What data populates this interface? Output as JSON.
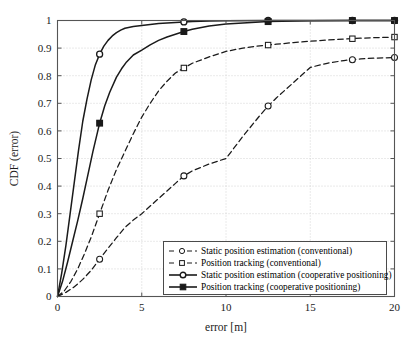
{
  "chart_data": {
    "type": "line",
    "title": "",
    "xlabel": "error [m]",
    "ylabel": "CDF (error)",
    "xlim": [
      0,
      20
    ],
    "ylim": [
      0,
      1
    ],
    "xticks": [
      "0",
      "5",
      "10",
      "15",
      "20"
    ],
    "xtick_values": [
      0,
      5,
      10,
      15,
      20
    ],
    "yticks": [
      "0",
      "0.1",
      "0.2",
      "0.3",
      "0.4",
      "0.5",
      "0.6",
      "0.7",
      "0.8",
      "0.9",
      "1"
    ],
    "ytick_values": [
      0,
      0.1,
      0.2,
      0.3,
      0.4,
      0.5,
      0.6,
      0.7,
      0.8,
      0.9,
      1
    ],
    "grid": true,
    "grid_style": "dotted",
    "legend_position": "lower right",
    "series": [
      {
        "name": "Static position estimation (conventional)",
        "style": "dashed",
        "marker": "circle",
        "marker_fill": "none",
        "color": "#1a1a1a",
        "x": [
          0,
          0.5,
          1,
          1.5,
          2,
          2.5,
          3,
          3.5,
          4,
          4.5,
          5,
          6,
          7,
          7.5,
          8,
          9,
          10,
          11,
          12,
          12.5,
          13,
          14,
          15,
          16,
          17,
          17.5,
          18,
          19,
          20
        ],
        "y": [
          0,
          0.015,
          0.035,
          0.062,
          0.095,
          0.135,
          0.175,
          0.213,
          0.25,
          0.277,
          0.3,
          0.355,
          0.41,
          0.437,
          0.455,
          0.48,
          0.5,
          0.58,
          0.655,
          0.69,
          0.72,
          0.775,
          0.83,
          0.845,
          0.855,
          0.858,
          0.861,
          0.864,
          0.866
        ],
        "markers_x": [
          2.5,
          7.5,
          12.5,
          17.5,
          20
        ],
        "markers_y": [
          0.135,
          0.437,
          0.69,
          0.858,
          0.866
        ]
      },
      {
        "name": "Position tracking (conventional)",
        "style": "dashed",
        "marker": "square",
        "marker_fill": "none",
        "color": "#1a1a1a",
        "x": [
          0,
          0.4,
          0.8,
          1.2,
          1.6,
          2,
          2.5,
          3,
          3.5,
          4,
          4.5,
          5,
          5.5,
          6,
          6.5,
          7,
          7.5,
          8,
          9,
          10,
          11,
          12,
          12.5,
          13,
          14,
          15,
          16,
          17,
          17.5,
          18,
          19,
          20
        ],
        "y": [
          0,
          0.02,
          0.055,
          0.1,
          0.155,
          0.215,
          0.3,
          0.385,
          0.46,
          0.525,
          0.59,
          0.65,
          0.7,
          0.745,
          0.78,
          0.81,
          0.828,
          0.845,
          0.868,
          0.888,
          0.9,
          0.908,
          0.911,
          0.914,
          0.92,
          0.925,
          0.929,
          0.933,
          0.934,
          0.936,
          0.938,
          0.94
        ],
        "markers_x": [
          2.5,
          7.5,
          12.5,
          17.5,
          20
        ],
        "markers_y": [
          0.3,
          0.828,
          0.911,
          0.934,
          0.94
        ]
      },
      {
        "name": "Static position estimation (cooperative positioning)",
        "style": "solid",
        "marker": "circle",
        "marker_fill": "none",
        "color": "#1a1a1a",
        "x": [
          0,
          0.25,
          0.5,
          0.75,
          1,
          1.25,
          1.5,
          1.75,
          2,
          2.25,
          2.5,
          2.75,
          3,
          3.25,
          3.5,
          3.75,
          4,
          4.5,
          5,
          6,
          7,
          7.5,
          8,
          9,
          10,
          12.5,
          15,
          17.5,
          20
        ],
        "y": [
          0,
          0.085,
          0.185,
          0.3,
          0.415,
          0.53,
          0.635,
          0.715,
          0.785,
          0.84,
          0.878,
          0.907,
          0.928,
          0.944,
          0.956,
          0.965,
          0.972,
          0.978,
          0.982,
          0.989,
          0.993,
          0.995,
          0.996,
          0.998,
          0.999,
          1.0,
          1.0,
          1.0,
          1.0
        ],
        "markers_x": [
          2.5,
          7.5,
          12.5,
          17.5,
          20
        ],
        "markers_y": [
          0.878,
          0.995,
          1.0,
          1.0,
          1.0
        ]
      },
      {
        "name": "Position tracking (cooperative positioning)",
        "style": "solid",
        "marker": "square",
        "marker_fill": "solid",
        "color": "#1a1a1a",
        "x": [
          0,
          0.3,
          0.6,
          0.9,
          1.2,
          1.5,
          1.8,
          2.1,
          2.5,
          2.8,
          3.1,
          3.5,
          3.8,
          4.1,
          4.5,
          5,
          5.5,
          6,
          6.5,
          7,
          7.5,
          8,
          9,
          10,
          12.5,
          15,
          17.5,
          20
        ],
        "y": [
          0,
          0.055,
          0.125,
          0.2,
          0.275,
          0.355,
          0.44,
          0.525,
          0.628,
          0.69,
          0.74,
          0.795,
          0.825,
          0.85,
          0.875,
          0.893,
          0.912,
          0.928,
          0.94,
          0.95,
          0.96,
          0.968,
          0.98,
          0.987,
          0.996,
          0.999,
          1.0,
          1.0
        ],
        "markers_x": [
          2.5,
          7.5,
          12.5,
          17.5,
          20
        ],
        "markers_y": [
          0.628,
          0.96,
          0.996,
          1.0,
          1.0
        ]
      }
    ]
  },
  "legend": {
    "items": [
      "Static position estimation (conventional)",
      "Position tracking (conventional)",
      "Static position estimation (cooperative positioning)",
      "Position tracking (cooperative positioning)"
    ]
  },
  "axes": {
    "x_label": "error [m]",
    "y_label": "CDF (error)"
  }
}
